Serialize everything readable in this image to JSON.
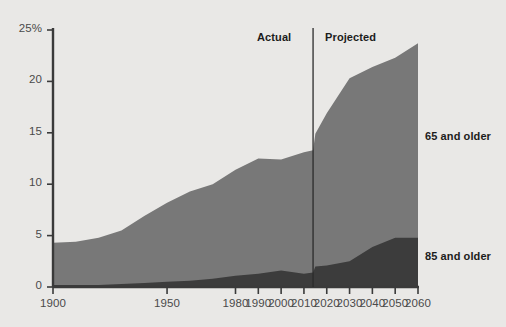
{
  "chart_data": {
    "type": "area",
    "stacked": true,
    "title": "",
    "subtitle": "",
    "xlabel": "",
    "ylabel": "",
    "xlim": [
      1900,
      2060
    ],
    "ylim": [
      0,
      25
    ],
    "grid": false,
    "legend_position": "right-inline",
    "x_tick_labels": [
      "1900",
      "1950",
      "1980",
      "1990",
      "2000",
      "2010",
      "2020",
      "2030",
      "2040",
      "2050",
      "2060"
    ],
    "x_tick_values": [
      1900,
      1950,
      1980,
      1990,
      2000,
      2010,
      2020,
      2030,
      2040,
      2050,
      2060
    ],
    "y_tick_labels": [
      "0",
      "5",
      "10",
      "15",
      "20",
      "25%"
    ],
    "y_tick_values": [
      0,
      5,
      10,
      15,
      20,
      25
    ],
    "annotations": [
      {
        "text": "Actual",
        "x": 2005,
        "y": 24
      },
      {
        "text": "Projected",
        "x": 2022,
        "y": 24
      }
    ],
    "divider": {
      "x": 2014,
      "label_left": "Actual",
      "label_right": "Projected"
    },
    "colors": {
      "background": "#e9e8e6",
      "series_65_and_older": "#787878",
      "series_85_and_older": "#3c3c3c",
      "axis": "#3a3a3a",
      "text": "#3d3d3d",
      "annotation_text": "#1c1c1c"
    },
    "series": [
      {
        "name": "65 and older",
        "label": "65 and older",
        "color": "#787878",
        "note": "total share of population age 65+ (upper boundary of stacked area)",
        "x": [
          1900,
          1910,
          1920,
          1930,
          1940,
          1950,
          1960,
          1970,
          1980,
          1990,
          2000,
          2010,
          2014,
          2015,
          2020,
          2030,
          2040,
          2050,
          2060
        ],
        "values": [
          4.3,
          4.4,
          4.8,
          5.5,
          6.9,
          8.2,
          9.3,
          10.0,
          11.4,
          12.5,
          12.4,
          13.1,
          13.3,
          14.9,
          16.9,
          20.3,
          21.4,
          22.3,
          23.7
        ]
      },
      {
        "name": "85 and older",
        "label": "85 and older",
        "color": "#3c3c3c",
        "note": "share of population age 85+ (lower band of stacked area)",
        "x": [
          1900,
          1910,
          1920,
          1930,
          1940,
          1950,
          1960,
          1970,
          1980,
          1990,
          2000,
          2010,
          2014,
          2015,
          2020,
          2030,
          2040,
          2050,
          2060
        ],
        "values": [
          0.2,
          0.2,
          0.2,
          0.3,
          0.4,
          0.5,
          0.6,
          0.8,
          1.1,
          1.3,
          1.6,
          1.3,
          1.4,
          2.0,
          2.1,
          2.5,
          3.9,
          4.8,
          4.8
        ]
      }
    ]
  },
  "axes": {
    "y_axis_name": "percent-of-population",
    "x_axis_name": "year"
  },
  "labels": {
    "actual": "Actual",
    "projected": "Projected",
    "legend_65": "65 and older",
    "legend_85": "85 and older",
    "y_top": "25%"
  }
}
